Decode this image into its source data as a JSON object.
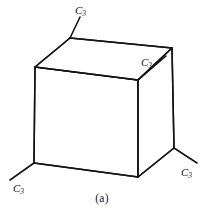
{
  "figure": {
    "caption": "(a)",
    "caption_top_px": 192,
    "shape": "cube",
    "line_color": "#141414",
    "background_color": "#ffffff",
    "line_width_px": 1.5,
    "axis_line_width_px": 1.6,
    "cube": {
      "front_face": [
        {
          "x": 35,
          "y": 67
        },
        {
          "x": 138,
          "y": 80
        },
        {
          "x": 138,
          "y": 177
        },
        {
          "x": 34,
          "y": 163
        }
      ],
      "back_top_left": {
        "x": 70,
        "y": 38
      },
      "back_top_right": {
        "x": 172,
        "y": 48
      },
      "back_bottom_right": {
        "x": 174,
        "y": 148
      }
    },
    "axes": [
      {
        "id": "c3-top-left",
        "label": "C",
        "subscript": "3",
        "vertex": {
          "x": 70,
          "y": 38
        },
        "tip": {
          "x": 80,
          "y": 17
        },
        "label_x": 75,
        "label_y": 14
      },
      {
        "id": "c3-center-right",
        "label": "C",
        "subscript": "3",
        "vertex": {
          "x": 138,
          "y": 80
        },
        "tip": {
          "x": 166,
          "y": 56
        },
        "label_x": 141,
        "label_y": 66
      },
      {
        "id": "c3-bottom-left",
        "label": "C",
        "subscript": "3",
        "vertex": {
          "x": 34,
          "y": 163
        },
        "tip": {
          "x": 10,
          "y": 180
        },
        "label_x": 13,
        "label_y": 192
      },
      {
        "id": "c3-bottom-right",
        "label": "C",
        "subscript": "3",
        "vertex": {
          "x": 174,
          "y": 148
        },
        "tip": {
          "x": 197,
          "y": 163
        },
        "label_x": 181,
        "label_y": 176
      }
    ]
  }
}
